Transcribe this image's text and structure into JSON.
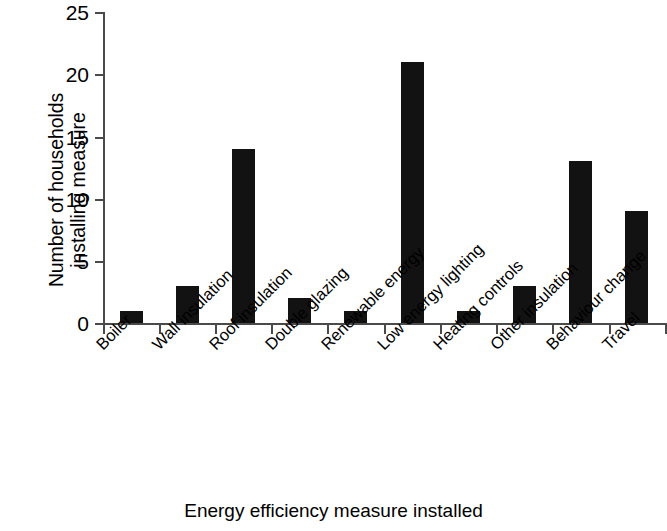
{
  "chart_data": {
    "type": "bar",
    "title": "",
    "xlabel": "Energy efficiency measure installed",
    "ylabel_lines": [
      "Number of households",
      "installing measure"
    ],
    "ylabel": "Number of households installing measure",
    "categories": [
      "Boiler",
      "Wall insulation",
      "Roof insulation",
      "Double glazing",
      "Renewable energy",
      "Low energy lighting",
      "Heating controls",
      "Other insulation",
      "Behaviour change",
      "Travel"
    ],
    "values": [
      1,
      3,
      14,
      2,
      1,
      21,
      1,
      3,
      13,
      9
    ],
    "ylim": [
      0,
      25
    ],
    "ytick_labels": [
      "25",
      "20",
      "15",
      "10",
      "5",
      "0"
    ],
    "yticks": [
      25,
      20,
      15,
      10,
      5,
      0
    ],
    "grid": false,
    "legend": null,
    "bar_color": "#121212",
    "axis_color": "#4a4a4a"
  }
}
